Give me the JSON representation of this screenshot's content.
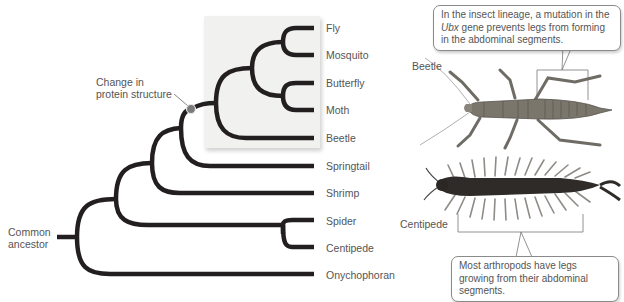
{
  "tree": {
    "root_label": "Common ancestor",
    "root_label_lines": [
      "Common",
      "ancestor"
    ],
    "annotation": {
      "lines": [
        "Change in",
        "protein structure"
      ],
      "marker_color": "#7a7a7a"
    },
    "highlight_group": "Insects",
    "leaves": [
      "Fly",
      "Mosquito",
      "Butterfly",
      "Moth",
      "Beetle",
      "Springtail",
      "Shrimp",
      "Spider",
      "Centipede",
      "Onychophoran"
    ],
    "branch_color": "#231f20",
    "shade_color": "#f1f1f0"
  },
  "specimens": {
    "beetle": {
      "label": "Beetle",
      "callout_parts": [
        "In the insect lineage, a mutation in the ",
        "Ubx",
        " gene prevents legs from forming in the abdominal segments."
      ]
    },
    "centipede": {
      "label": "Centipede",
      "callout": "Most arthropods have legs growing from their abdominal segments."
    }
  }
}
